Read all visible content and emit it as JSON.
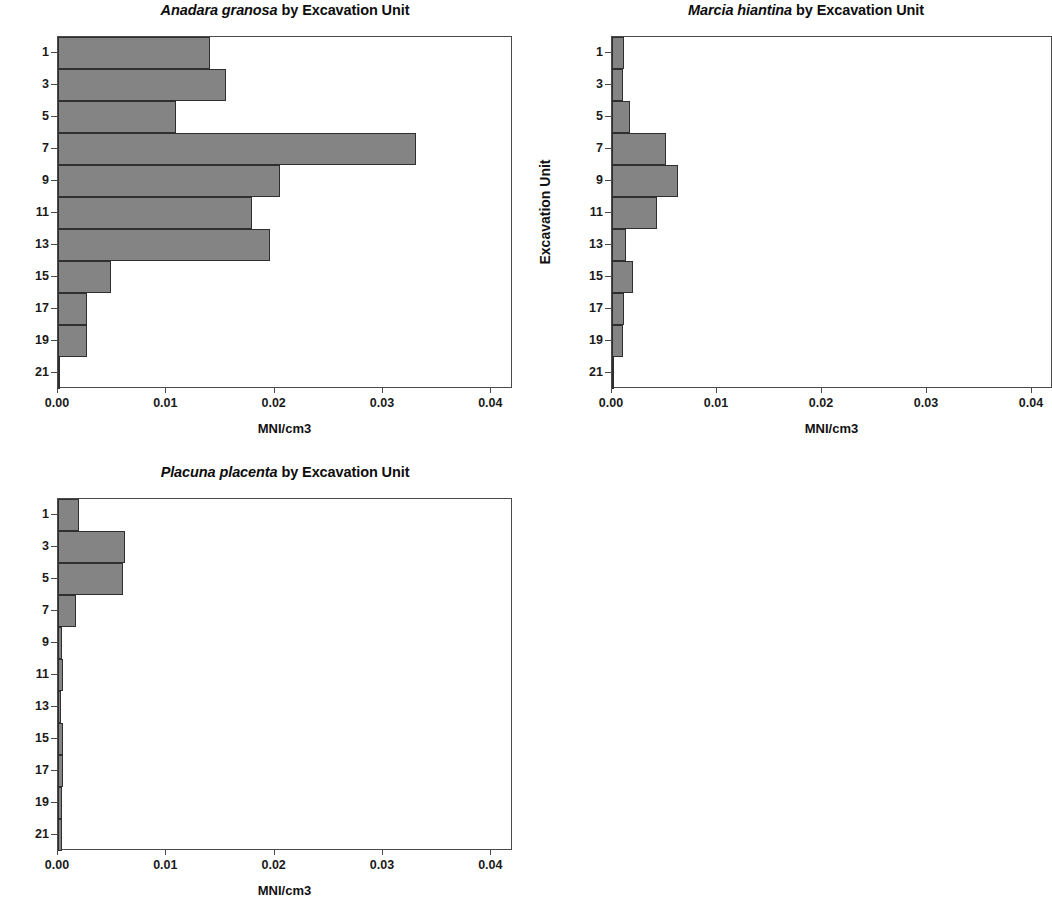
{
  "figure": {
    "background_color": "#ffffff",
    "bar_fill_color": "#848484",
    "bar_edge_color": "#2f2f2f",
    "axis_color": "#4a4a4a"
  },
  "panels": [
    {
      "id": "anadara-granosa",
      "title_species": "Anadara granosa",
      "title_rest": " by Excavation Unit",
      "xlabel": "MNI/cm3",
      "ylabel": "Excavation Unit"
    },
    {
      "id": "marcia-hiantina",
      "title_species": "Marcia hiantina",
      "title_rest": " by Excavation Unit",
      "xlabel": "MNI/cm3",
      "ylabel": "Excavation Unit"
    },
    {
      "id": "placuna-placenta",
      "title_species": "Placuna placenta",
      "title_rest": " by Excavation Unit",
      "xlabel": "MNI/cm3",
      "ylabel": "Excavation Unit"
    }
  ],
  "chart_data": [
    {
      "type": "bar",
      "orientation": "horizontal",
      "title": "Anadara granosa by Excavation Unit",
      "title_species_italic": "Anadara granosa",
      "xlabel": "MNI/cm3",
      "ylabel": "Excavation Unit",
      "xlim": [
        0,
        0.042
      ],
      "xticks": [
        0,
        0.01,
        0.02,
        0.03,
        0.04
      ],
      "xticklabels": [
        "0.00",
        "0.01",
        "0.02",
        "0.03",
        "0.04"
      ],
      "ylim": [
        0,
        22
      ],
      "yticks": [
        1,
        3,
        5,
        7,
        9,
        11,
        13,
        15,
        17,
        19,
        21
      ],
      "yticklabels": [
        "1",
        "3",
        "5",
        "7",
        "9",
        "11",
        "13",
        "15",
        "17",
        "19",
        "21"
      ],
      "y_inverted": true,
      "grid": false,
      "legend": null,
      "bin_width_units": 2,
      "categories": [
        "1",
        "3",
        "5",
        "7",
        "9",
        "11",
        "13",
        "15",
        "17",
        "19",
        "21"
      ],
      "values": [
        0.014,
        0.0155,
        0.0109,
        0.033,
        0.0205,
        0.0179,
        0.0196,
        0.0049,
        0.0027,
        0.0027,
        0.0002
      ]
    },
    {
      "type": "bar",
      "orientation": "horizontal",
      "title": "Marcia hiantina by Excavation Unit",
      "title_species_italic": "Marcia hiantina",
      "xlabel": "MNI/cm3",
      "ylabel": "Excavation Unit",
      "xlim": [
        0,
        0.042
      ],
      "xticks": [
        0,
        0.01,
        0.02,
        0.03,
        0.04
      ],
      "xticklabels": [
        "0.00",
        "0.01",
        "0.02",
        "0.03",
        "0.04"
      ],
      "ylim": [
        0,
        22
      ],
      "yticks": [
        1,
        3,
        5,
        7,
        9,
        11,
        13,
        15,
        17,
        19,
        21
      ],
      "yticklabels": [
        "1",
        "3",
        "5",
        "7",
        "9",
        "11",
        "13",
        "15",
        "17",
        "19",
        "21"
      ],
      "y_inverted": true,
      "grid": false,
      "legend": null,
      "bin_width_units": 2,
      "categories": [
        "1",
        "3",
        "5",
        "7",
        "9",
        "11",
        "13",
        "15",
        "17",
        "19",
        "21"
      ],
      "values": [
        0.0011,
        0.001,
        0.0017,
        0.0051,
        0.0063,
        0.0043,
        0.0013,
        0.002,
        0.0011,
        0.001,
        0.0002
      ]
    },
    {
      "type": "bar",
      "orientation": "horizontal",
      "title": "Placuna placenta by Excavation Unit",
      "title_species_italic": "Placuna placenta",
      "xlabel": "MNI/cm3",
      "ylabel": "Excavation Unit",
      "xlim": [
        0,
        0.042
      ],
      "xticks": [
        0,
        0.01,
        0.02,
        0.03,
        0.04
      ],
      "xticklabels": [
        "0.00",
        "0.01",
        "0.02",
        "0.03",
        "0.04"
      ],
      "ylim": [
        0,
        22
      ],
      "yticks": [
        1,
        3,
        5,
        7,
        9,
        11,
        13,
        15,
        17,
        19,
        21
      ],
      "yticklabels": [
        "1",
        "3",
        "5",
        "7",
        "9",
        "11",
        "13",
        "15",
        "17",
        "19",
        "21"
      ],
      "y_inverted": true,
      "grid": false,
      "legend": null,
      "bin_width_units": 2,
      "categories": [
        "1",
        "3",
        "5",
        "7",
        "9",
        "11",
        "13",
        "15",
        "17",
        "19",
        "21"
      ],
      "values": [
        0.0019,
        0.0062,
        0.006,
        0.0017,
        0.0004,
        0.0005,
        0.0003,
        0.0005,
        0.0005,
        0.0004,
        0.0004
      ]
    }
  ]
}
